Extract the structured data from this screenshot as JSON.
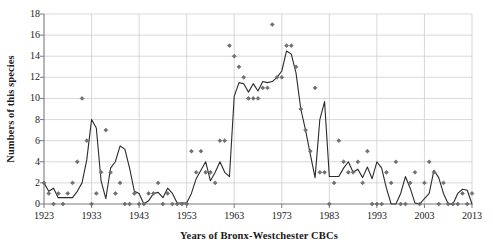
{
  "chart_data": {
    "type": "line",
    "title": "",
    "xlabel": "Years of Bronx-Westchester CBCs",
    "ylabel": "Numbers of this species",
    "xlim": [
      1923,
      2013
    ],
    "ylim": [
      0,
      18
    ],
    "x_ticks": [
      1923,
      1933,
      1943,
      1953,
      1963,
      1973,
      1983,
      1993,
      2003,
      2013
    ],
    "y_ticks": [
      0,
      2,
      4,
      6,
      8,
      10,
      12,
      14,
      16,
      18
    ],
    "grid": true,
    "legend": "none",
    "marker_color": "#6e6e6e",
    "line_color": "#2b2b2b",
    "axis_color": "#7a7a7a",
    "grid_color": "#c9c9c9",
    "series": [
      {
        "name": "Counts (scatter)",
        "type": "scatter",
        "x": [
          1923,
          1924,
          1925,
          1926,
          1927,
          1928,
          1929,
          1930,
          1931,
          1932,
          1933,
          1934,
          1935,
          1936,
          1937,
          1938,
          1939,
          1940,
          1941,
          1942,
          1943,
          1944,
          1945,
          1946,
          1947,
          1948,
          1949,
          1950,
          1951,
          1952,
          1953,
          1954,
          1955,
          1956,
          1957,
          1958,
          1959,
          1960,
          1961,
          1962,
          1963,
          1964,
          1965,
          1966,
          1967,
          1968,
          1969,
          1970,
          1971,
          1972,
          1973,
          1974,
          1975,
          1976,
          1977,
          1978,
          1979,
          1980,
          1981,
          1982,
          1983,
          1984,
          1985,
          1986,
          1987,
          1988,
          1989,
          1990,
          1991,
          1992,
          1993,
          1994,
          1995,
          1996,
          1997,
          1998,
          1999,
          2000,
          2001,
          2002,
          2003,
          2004,
          2005,
          2006,
          2007,
          2008,
          2009,
          2010,
          2011,
          2012,
          2013
        ],
        "y": [
          2,
          1,
          0,
          1,
          0,
          1,
          2,
          4,
          10,
          6,
          0,
          1,
          3,
          7,
          3,
          1,
          2,
          0,
          0,
          1,
          0,
          0,
          1,
          1,
          2,
          0,
          1,
          0,
          0,
          0,
          0,
          5,
          3,
          5,
          3,
          3,
          2,
          6,
          6,
          15,
          14,
          13,
          12,
          10,
          10,
          10,
          11,
          11,
          17,
          12,
          12,
          15,
          15,
          13,
          9,
          7,
          5,
          11,
          3,
          3,
          0,
          2,
          6,
          4,
          3,
          3,
          4,
          2,
          5,
          0,
          0,
          0,
          3,
          2,
          4,
          0,
          0,
          2,
          3,
          0,
          2,
          4,
          3,
          0,
          2,
          0,
          0,
          0,
          1,
          0,
          1
        ]
      },
      {
        "name": "Trend (line)",
        "type": "line",
        "x": [
          1923,
          1924,
          1925,
          1926,
          1927,
          1928,
          1929,
          1930,
          1931,
          1932,
          1933,
          1934,
          1935,
          1936,
          1937,
          1938,
          1939,
          1940,
          1941,
          1942,
          1943,
          1944,
          1945,
          1946,
          1947,
          1948,
          1949,
          1950,
          1951,
          1952,
          1953,
          1954,
          1955,
          1956,
          1957,
          1958,
          1959,
          1960,
          1961,
          1962,
          1963,
          1964,
          1965,
          1966,
          1967,
          1968,
          1969,
          1970,
          1971,
          1972,
          1973,
          1974,
          1975,
          1976,
          1977,
          1978,
          1979,
          1980,
          1981,
          1982,
          1983,
          1984,
          1985,
          1986,
          1987,
          1988,
          1989,
          1990,
          1991,
          1992,
          1993,
          1994,
          1995,
          1996,
          1997,
          1998,
          1999,
          2000,
          2001,
          2002,
          2003,
          2004,
          2005,
          2006,
          2007,
          2008,
          2009,
          2010,
          2011,
          2012,
          2013
        ],
        "y": [
          2,
          1.2,
          1.5,
          0.6,
          0.6,
          0.6,
          0.6,
          1.2,
          2.0,
          4.2,
          8.0,
          7.2,
          2.2,
          0.5,
          3.4,
          4.0,
          5.5,
          5.2,
          3.4,
          1.2,
          1.0,
          0.0,
          0.3,
          1.0,
          1.1,
          0.6,
          1.5,
          1.0,
          0.1,
          0.1,
          0.1,
          1.0,
          2.4,
          3.2,
          4.0,
          2.2,
          3.0,
          4.0,
          3.0,
          2.6,
          10.2,
          11.5,
          11.4,
          10.6,
          11.4,
          10.7,
          11.6,
          11.5,
          11.6,
          12.0,
          12.6,
          14.5,
          14.2,
          12.4,
          9.0,
          7.0,
          4.7,
          2.5,
          8.0,
          9.7,
          2.6,
          2.6,
          2.6,
          3.4,
          4.0,
          3.0,
          3.3,
          2.5,
          3.5,
          2.4,
          4.0,
          3.4,
          1.5,
          0.0,
          0.0,
          1.0,
          2.6,
          1.5,
          0.1,
          0.0,
          0.5,
          1.0,
          3.2,
          2.5,
          1.0,
          0.0,
          0.0,
          1.0,
          1.4,
          1.3,
          0.0
        ]
      }
    ]
  }
}
